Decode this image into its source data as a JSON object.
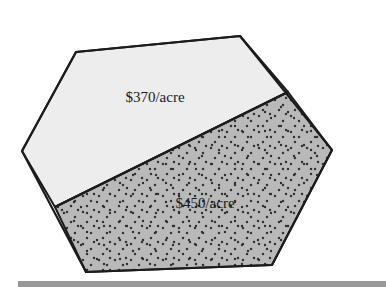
{
  "figure": {
    "background_color": "#ffffff",
    "width": 386,
    "height": 292
  },
  "parcel": {
    "outline_color": "#1c1c1c",
    "outline_width": 2,
    "vertices": [
      [
        76,
        52
      ],
      [
        240,
        36
      ],
      [
        332,
        150
      ],
      [
        272,
        265
      ],
      [
        86,
        272
      ],
      [
        22,
        151
      ]
    ],
    "divider": {
      "start": [
        55,
        207
      ],
      "end": [
        288,
        92
      ],
      "color": "#1c1c1c",
      "width": 2
    },
    "regions": [
      {
        "name": "upper-parcel",
        "label": "$370/acre",
        "fill_color": "#ededed",
        "pattern": "plain",
        "label_position": [
          155,
          99
        ],
        "polygon": [
          [
            76,
            52
          ],
          [
            240,
            36
          ],
          [
            288,
            92
          ],
          [
            55,
            207
          ],
          [
            22,
            151
          ]
        ]
      },
      {
        "name": "lower-parcel",
        "label": "$450/acre",
        "fill_color": "#b9b9b9",
        "pattern": "stippled",
        "dot_color": "#333333",
        "label_position": [
          205,
          205
        ],
        "polygon": [
          [
            288,
            92
          ],
          [
            332,
            150
          ],
          [
            272,
            265
          ],
          [
            86,
            272
          ],
          [
            55,
            207
          ]
        ]
      }
    ]
  },
  "baseline_bar": {
    "name": "bottom-rule",
    "x": 18,
    "y": 281,
    "width": 368,
    "height": 6,
    "color": "#989898"
  }
}
